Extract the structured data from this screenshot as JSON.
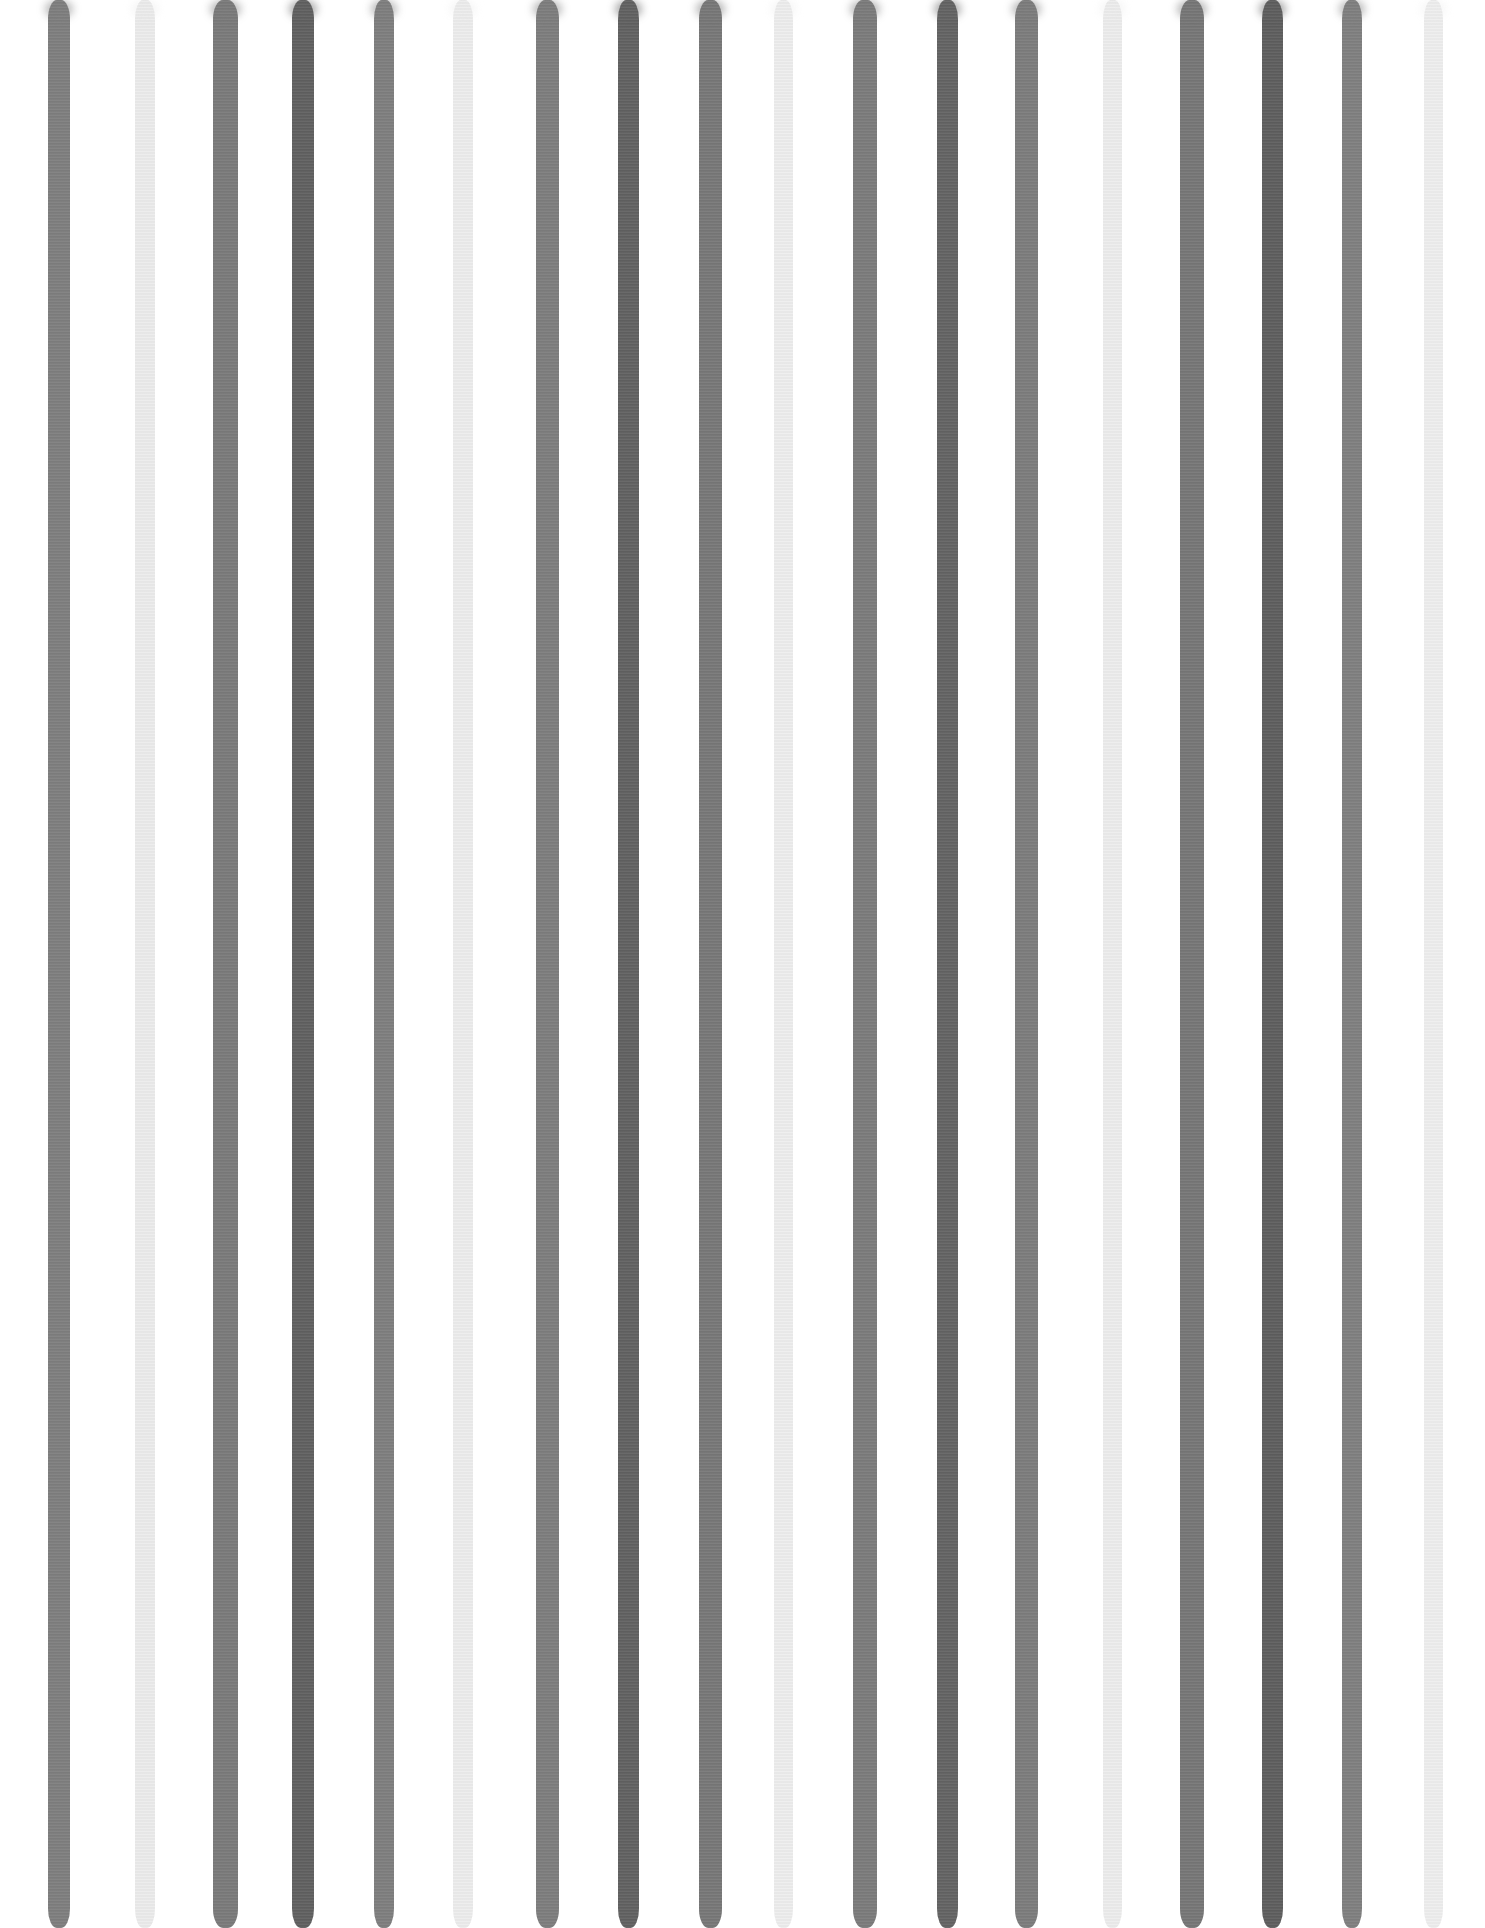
{
  "image": {
    "description": "Hand-painted watercolor vertical stripes in shades of gray on a white background",
    "width": 1485,
    "height": 1928,
    "background": "#ffffff"
  },
  "palette": {
    "medium": "#7e7e7e",
    "dark": "#5f5f5f",
    "light": "#ececec"
  },
  "stripes": [
    {
      "center": 59,
      "width": 22,
      "tone": "medium",
      "color": "#7e7e7e"
    },
    {
      "center": 145,
      "width": 20,
      "tone": "light",
      "color": "#ececec"
    },
    {
      "center": 225,
      "width": 25,
      "tone": "medium",
      "color": "#7a7a7a"
    },
    {
      "center": 303,
      "width": 22,
      "tone": "dark",
      "color": "#606060"
    },
    {
      "center": 384,
      "width": 20,
      "tone": "medium",
      "color": "#7e7e7e"
    },
    {
      "center": 463,
      "width": 20,
      "tone": "light",
      "color": "#ededed"
    },
    {
      "center": 547,
      "width": 23,
      "tone": "medium",
      "color": "#7d7d7d"
    },
    {
      "center": 628,
      "width": 21,
      "tone": "dark",
      "color": "#616161"
    },
    {
      "center": 710,
      "width": 23,
      "tone": "medium",
      "color": "#777777"
    },
    {
      "center": 783,
      "width": 19,
      "tone": "light",
      "color": "#eeeeee"
    },
    {
      "center": 865,
      "width": 24,
      "tone": "medium",
      "color": "#7b7b7b"
    },
    {
      "center": 947,
      "width": 21,
      "tone": "dark",
      "color": "#636363"
    },
    {
      "center": 1026,
      "width": 23,
      "tone": "medium",
      "color": "#7c7c7c"
    },
    {
      "center": 1112,
      "width": 19,
      "tone": "light",
      "color": "#ededed"
    },
    {
      "center": 1192,
      "width": 24,
      "tone": "medium",
      "color": "#767676"
    },
    {
      "center": 1272,
      "width": 21,
      "tone": "dark",
      "color": "#5e5e5e"
    },
    {
      "center": 1352,
      "width": 20,
      "tone": "medium",
      "color": "#7f7f7f"
    },
    {
      "center": 1433,
      "width": 19,
      "tone": "light",
      "color": "#efefef"
    }
  ]
}
